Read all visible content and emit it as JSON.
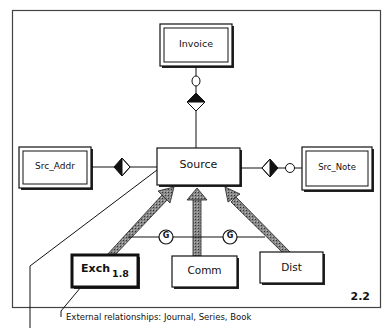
{
  "diagram": {
    "type": "entity-relationship",
    "figure_number": "2.2",
    "caption": "External relationships: Journal, Series, Book",
    "entities": [
      {
        "id": "invoice",
        "label": "Invoice",
        "style": "double-border"
      },
      {
        "id": "source",
        "label": "Source",
        "style": "single-border"
      },
      {
        "id": "src_addr",
        "label": "Src_Addr",
        "style": "double-border"
      },
      {
        "id": "src_note",
        "label": "Src_Note",
        "style": "double-border"
      },
      {
        "id": "exch",
        "label": "Exch",
        "subscript": "1.8",
        "style": "thick-border"
      },
      {
        "id": "comm",
        "label": "Comm",
        "style": "single-border"
      },
      {
        "id": "dist",
        "label": "Dist",
        "style": "single-border"
      }
    ],
    "relationships": [
      {
        "from": "invoice",
        "to": "source",
        "notation": "optional circle + half-filled diamond"
      },
      {
        "from": "src_addr",
        "to": "source",
        "notation": "half-filled diamond"
      },
      {
        "from": "src_note",
        "to": "source",
        "notation": "optional circle + half-filled diamond"
      },
      {
        "from": "exch",
        "to": "source",
        "notation": "generalization arrow"
      },
      {
        "from": "comm",
        "to": "source",
        "notation": "generalization arrow"
      },
      {
        "from": "dist",
        "to": "source",
        "notation": "generalization arrow"
      }
    ],
    "generalization_markers": [
      "G",
      "G"
    ],
    "colors": {
      "line": "#111111",
      "arrow_fill": "#777777",
      "background": "#ffffff"
    }
  }
}
